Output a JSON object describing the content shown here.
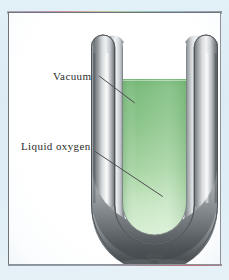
{
  "figure": {
    "type": "scientific-diagram",
    "frame": {
      "background_color": "#dfeef6",
      "plate_color": "#fefefe",
      "border_color": "#6e7478"
    }
  },
  "annotations": [
    {
      "id": "vacuum",
      "label": "Vacuum",
      "leader_from": [
        92,
        67
      ],
      "leader_to": [
        124,
        92
      ],
      "points_at": "tube-wall-cavity"
    },
    {
      "id": "liquid-oxygen",
      "label": "Liquid oxygen",
      "leader_from": [
        88,
        137
      ],
      "leader_to": [
        151,
        179
      ],
      "points_at": "liquid-body"
    }
  ],
  "apparatus": {
    "name": "u-tube-dewar",
    "tube_wall_color_dark": "#5a5f63",
    "tube_wall_color_light": "#e9ebec",
    "liquid_color_top": "#7fbd80",
    "liquid_color_bottom": "#d4ecd2",
    "liquid_surface_level_label": "liquid surface",
    "bottom_tip": "sealed glass pip"
  },
  "colors": {
    "accent_green": "#8cc78c",
    "metal_gray": "#9aa0a4",
    "paper_blue": "#dfeef6",
    "ink": "#2a2a2a"
  }
}
